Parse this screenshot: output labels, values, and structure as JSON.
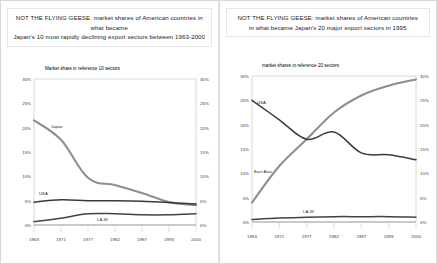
{
  "slide": {
    "background_color": "#ffffff",
    "panels": [
      {
        "id": "left",
        "title_line1": "NOT THE FLYING GEESE: market shares of American countries in what became",
        "title_line2": "Japan's 10 most rapidly declining export sectors between 1963-2000",
        "subtitle": "Market share in reference 10 sectors"
      },
      {
        "id": "right",
        "title_line1": "NOT THE FLYING GEESE: market shares of American countries",
        "title_line2": "in what became Japan's 20 major export sectors in 1995",
        "subtitle": "market shares in reference 20 sectors"
      }
    ]
  },
  "chart_data": [
    {
      "type": "line",
      "title": "NOT THE FLYING GEESE: market shares of American countries in what became Japan's 10 most rapidly declining export sectors between 1963-2000",
      "subtitle": "Market share in reference 10 sectors",
      "xlabel": "",
      "ylabel": "",
      "ylim": [
        0,
        30
      ],
      "yticks": [
        0,
        5,
        10,
        15,
        20,
        25,
        30
      ],
      "ytick_labels": [
        "0%",
        "5%",
        "10%",
        "15%",
        "20%",
        "25%",
        "30%"
      ],
      "dual_axis": true,
      "grid": false,
      "legend": "inline-labels",
      "categories": [
        "1963",
        "1971",
        "1977",
        "1982",
        "1987",
        "1993",
        "2000"
      ],
      "series": [
        {
          "name": "Japan",
          "color": "#8f8f8f",
          "values": [
            21.5,
            17.5,
            9.7,
            8.2,
            6.6,
            4.7,
            4.1
          ],
          "label_x": "1963",
          "label_anchor": "start"
        },
        {
          "name": "USA",
          "color": "#3a3a3a",
          "values": [
            4.7,
            5.2,
            5.0,
            5.0,
            4.9,
            4.6,
            4.3
          ],
          "label_x": "1963",
          "label_anchor": "start"
        },
        {
          "name": "LA-W",
          "color": "#4a4038",
          "values": [
            0.7,
            1.4,
            2.3,
            2.3,
            2.1,
            2.1,
            2.3
          ],
          "label_x": "1977",
          "label_anchor": "middle"
        }
      ]
    },
    {
      "type": "line",
      "title": "NOT THE FLYING GEESE: market shares of American countries in what became Japan's 20 major export sectors in 1995",
      "subtitle": "market shares in reference 20 sectors",
      "xlabel": "",
      "ylabel": "",
      "ylim": [
        0,
        30
      ],
      "yticks": [
        0,
        5,
        10,
        15,
        20,
        25,
        30
      ],
      "ytick_labels": [
        "0%",
        "5%",
        "10%",
        "15%",
        "20%",
        "25%",
        "30%"
      ],
      "dual_axis": true,
      "grid": false,
      "legend": "inline-labels",
      "categories": [
        "1963",
        "1971",
        "1977",
        "1982",
        "1987",
        "1993",
        "2000"
      ],
      "series": [
        {
          "name": "East Asia",
          "color": "#8f8f8f",
          "values": [
            4.0,
            11.5,
            17.0,
            22.5,
            26.0,
            28.0,
            29.3
          ],
          "label_x": "1971",
          "label_anchor": "end"
        },
        {
          "name": "USA",
          "color": "#3a3a3a",
          "values": [
            25.0,
            21.0,
            17.0,
            18.5,
            14.2,
            13.8,
            12.8
          ],
          "label_x": "1963",
          "label_anchor": "start"
        },
        {
          "name": "LA-W",
          "color": "#4a4038",
          "values": [
            0.5,
            0.8,
            1.0,
            1.1,
            1.1,
            1.1,
            1.0
          ],
          "label_x": "1977",
          "label_anchor": "middle"
        }
      ]
    }
  ]
}
